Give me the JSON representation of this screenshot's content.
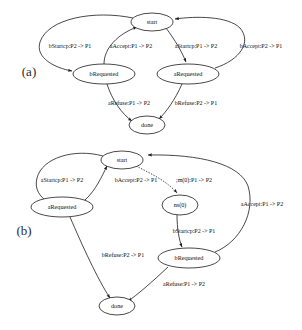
{
  "figure": {
    "panels": [
      {
        "id": "panel-a",
        "label": "(a)",
        "nodes": [
          {
            "id": "start",
            "label": "start",
            "cx": 152,
            "cy": 22,
            "rx": 21,
            "ry": 9
          },
          {
            "id": "bRequested",
            "label": "bRequested",
            "cx": 104,
            "cy": 74,
            "rx": 31,
            "ry": 10
          },
          {
            "id": "aRequested",
            "label": "aRequested",
            "cx": 188,
            "cy": 74,
            "rx": 31,
            "ry": 10
          },
          {
            "id": "done",
            "label": "done",
            "cx": 147,
            "cy": 125,
            "rx": 18,
            "ry": 9
          }
        ],
        "edges": [
          {
            "id": "a-e1",
            "from": "start",
            "to": "bRequested",
            "label": "bStartcp:P2 -> P1",
            "style": "solid"
          },
          {
            "id": "a-e2",
            "from": "bRequested",
            "to": "start",
            "label": "aAccept:P1 -> P2",
            "style": "solid"
          },
          {
            "id": "a-e3",
            "from": "start",
            "to": "aRequested",
            "label": "aStartcp:P1 -> P2",
            "style": "solid"
          },
          {
            "id": "a-e4",
            "from": "aRequested",
            "to": "start",
            "label": "bAccept:P2 -> P1",
            "style": "solid"
          },
          {
            "id": "a-e5",
            "from": "bRequested",
            "to": "done",
            "label": "aRefuse:P1 -> P2",
            "style": "solid"
          },
          {
            "id": "a-e6",
            "from": "aRequested",
            "to": "done",
            "label": "bRefuse:P2 -> P1",
            "style": "solid"
          }
        ]
      },
      {
        "id": "panel-b",
        "label": "(b)",
        "nodes": [
          {
            "id": "start",
            "label": "start",
            "cx": 122,
            "cy": 160,
            "rx": 21,
            "ry": 9
          },
          {
            "id": "aRequested",
            "label": "aRequested",
            "cx": 62,
            "cy": 207,
            "rx": 31,
            "ry": 10
          },
          {
            "id": "ns0",
            "label": "ns(0)",
            "cx": 180,
            "cy": 205,
            "rx": 18,
            "ry": 10
          },
          {
            "id": "bRequested",
            "label": "bRequested",
            "cx": 189,
            "cy": 258,
            "rx": 31,
            "ry": 10
          },
          {
            "id": "done",
            "label": "done",
            "cx": 117,
            "cy": 306,
            "rx": 18,
            "ry": 9
          }
        ],
        "edges": [
          {
            "id": "b-e1",
            "from": "start",
            "to": "aRequested",
            "label": "aStartcp:P1 -> P2",
            "style": "solid"
          },
          {
            "id": "b-e2",
            "from": "aRequested",
            "to": "start",
            "label": "bAccept:P2 -> P1",
            "style": "solid"
          },
          {
            "id": "b-e3",
            "from": "start",
            "to": "ns0",
            "label": ";m(0):P1 -> P2",
            "style": "dotted"
          },
          {
            "id": "b-e4",
            "from": "bRequested",
            "to": "start",
            "label": "aAccept:P1 -> P2",
            "style": "solid"
          },
          {
            "id": "b-e5",
            "from": "ns0",
            "to": "bRequested",
            "label": "bStartcp:P2 -> P1",
            "style": "solid"
          },
          {
            "id": "b-e6",
            "from": "aRequested",
            "to": "done",
            "label": "bRefuse:P2 -> P1",
            "style": "solid"
          },
          {
            "id": "b-e7",
            "from": "bRequested",
            "to": "done",
            "label": "aRefuse:P1 -> P2",
            "style": "solid"
          }
        ]
      }
    ],
    "labels": {
      "a_panel": "(a)",
      "b_panel": "(b)",
      "a_start": "start",
      "a_bRequested": "bRequested",
      "a_aRequested": "aRequested",
      "a_done": "done",
      "a_edge_bStartcp": "bStartcp:P2 -> P1",
      "a_edge_aAccept": "aAccept:P1 -> P2",
      "a_edge_aStartcp": "aStartcp:P1 -> P2",
      "a_edge_bAccept": "bAccept:P2 -> P1",
      "a_edge_aRefuse": "aRefuse:P1 -> P2",
      "a_edge_bRefuse": "bRefuse:P2 -> P1",
      "b_start": "start",
      "b_aRequested": "aRequested",
      "b_ns0": "ns(0)",
      "b_bRequested": "bRequested",
      "b_done": "done",
      "b_edge_aStartcp": "aStartcp:P1 -> P2",
      "b_edge_bAccept": "bAccept:P2 -> P1",
      "b_edge_m0": ";m(0):P1 -> P2",
      "b_edge_aAccept": "aAccept:P1 -> P2",
      "b_edge_bStartcp": "bStartcp:P2 -> P1",
      "b_edge_bRefuse": "bRefuse:P2 -> P1",
      "b_edge_aRefuse": "aRefuse:P1 -> P2"
    },
    "colors": {
      "stroke": "#1a1a1a",
      "node_fill": "#ffffff",
      "text": "#111111",
      "background": "#ffffff"
    }
  }
}
